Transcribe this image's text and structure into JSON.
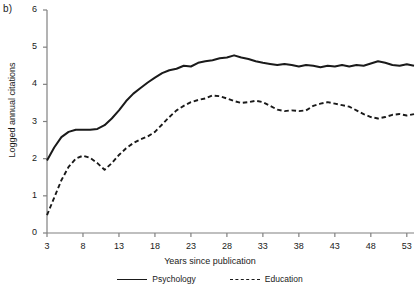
{
  "panel": {
    "label": "b)"
  },
  "axes": {
    "y_label": "Logged annual citations",
    "x_label": "Years since publication",
    "y_ticks": [
      0,
      1,
      2,
      3,
      4,
      5,
      6
    ],
    "x_ticks": [
      3,
      8,
      13,
      18,
      23,
      28,
      33,
      38,
      43,
      48,
      53
    ]
  },
  "legend": {
    "items": [
      {
        "label": "Psychology",
        "style": "solid"
      },
      {
        "label": "Education",
        "style": "dashed"
      }
    ]
  },
  "colors": {
    "line": "#1a1a1a",
    "axis": "#808080",
    "background": "#ffffff"
  },
  "chart_data": {
    "type": "line",
    "title": "",
    "xlabel": "Years since publication",
    "ylabel": "Logged annual citations",
    "xlim": [
      3,
      54
    ],
    "ylim": [
      0,
      6
    ],
    "grid": false,
    "legend_position": "bottom",
    "x": [
      3,
      4,
      5,
      6,
      7,
      8,
      9,
      10,
      11,
      12,
      13,
      14,
      15,
      16,
      17,
      18,
      19,
      20,
      21,
      22,
      23,
      24,
      25,
      26,
      27,
      28,
      29,
      30,
      31,
      32,
      33,
      34,
      35,
      36,
      37,
      38,
      39,
      40,
      41,
      42,
      43,
      44,
      45,
      46,
      47,
      48,
      49,
      50,
      51,
      52,
      53,
      54
    ],
    "series": [
      {
        "name": "Psychology",
        "style": "solid",
        "values": [
          1.95,
          2.3,
          2.58,
          2.72,
          2.78,
          2.78,
          2.78,
          2.8,
          2.9,
          3.08,
          3.3,
          3.55,
          3.75,
          3.9,
          4.05,
          4.18,
          4.3,
          4.38,
          4.42,
          4.5,
          4.48,
          4.58,
          4.62,
          4.65,
          4.7,
          4.72,
          4.78,
          4.72,
          4.68,
          4.62,
          4.58,
          4.55,
          4.52,
          4.55,
          4.52,
          4.48,
          4.52,
          4.5,
          4.46,
          4.5,
          4.48,
          4.52,
          4.48,
          4.52,
          4.5,
          4.56,
          4.62,
          4.58,
          4.52,
          4.5,
          4.54,
          4.5
        ]
      },
      {
        "name": "Education",
        "style": "dashed",
        "values": [
          0.48,
          0.95,
          1.42,
          1.78,
          2.0,
          2.08,
          2.02,
          1.88,
          1.7,
          1.88,
          2.1,
          2.28,
          2.42,
          2.52,
          2.6,
          2.72,
          2.92,
          3.12,
          3.3,
          3.42,
          3.52,
          3.58,
          3.62,
          3.7,
          3.68,
          3.62,
          3.55,
          3.5,
          3.52,
          3.56,
          3.52,
          3.42,
          3.32,
          3.28,
          3.3,
          3.28,
          3.3,
          3.42,
          3.48,
          3.52,
          3.48,
          3.44,
          3.4,
          3.3,
          3.2,
          3.12,
          3.08,
          3.12,
          3.18,
          3.2,
          3.16,
          3.2
        ]
      }
    ]
  }
}
